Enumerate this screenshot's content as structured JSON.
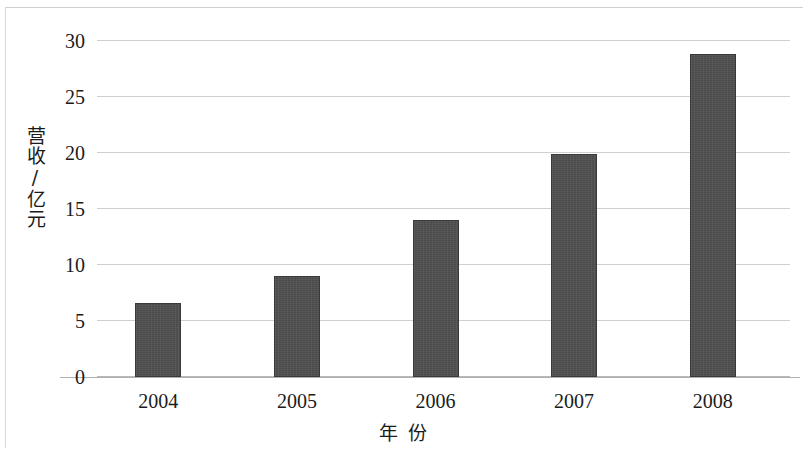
{
  "chart_data": {
    "type": "bar",
    "title": "",
    "xlabel": "年 份",
    "ylabel": "营收/亿元",
    "categories": [
      "2004",
      "2005",
      "2006",
      "2007",
      "2008"
    ],
    "values": [
      6.6,
      9.0,
      14.0,
      19.9,
      28.8
    ],
    "series": [
      {
        "name": "营收/亿元",
        "values": [
          6.6,
          9.0,
          14.0,
          19.9,
          28.8
        ]
      }
    ],
    "ylim": [
      0,
      30
    ],
    "ytick_labels": [
      "0",
      "5",
      "10",
      "15",
      "20",
      "25",
      "30"
    ],
    "ytick_values": [
      0,
      5,
      10,
      15,
      20,
      25,
      30
    ],
    "xtick_labels": [
      "2004",
      "2005",
      "2006",
      "2007",
      "2008"
    ],
    "grid": true,
    "grid_axis": "y",
    "legend": false,
    "legend_position": "none",
    "bar_color": "#4b4b4b",
    "grid_color": "#cfcfcf",
    "text_color": "#1b1b1b"
  }
}
